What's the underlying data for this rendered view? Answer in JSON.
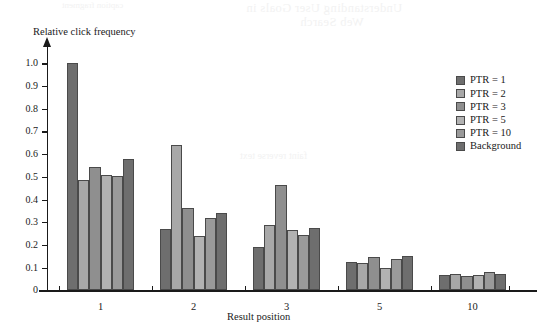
{
  "figure": {
    "ylabel": "Relative click frequency",
    "xlabel": "Result position"
  },
  "bleed_through": {
    "line1": "Understanding User Goals in",
    "line2": "Web Search",
    "line3": "caption fragment",
    "line4": "faint reverse text"
  },
  "legend": {
    "items": [
      {
        "label": "PTR = 1",
        "color": "#6e6e6e"
      },
      {
        "label": "PTR = 2",
        "color": "#a8a8a8"
      },
      {
        "label": "PTR = 3",
        "color": "#8f8f8f"
      },
      {
        "label": "PTR = 5",
        "color": "#b2b2b2"
      },
      {
        "label": "PTR = 10",
        "color": "#9a9a9a"
      },
      {
        "label": "Background",
        "color": "#6e6e6e"
      }
    ]
  },
  "chart_data": {
    "type": "bar",
    "title": "",
    "xlabel": "Result position",
    "ylabel": "Relative click frequency",
    "categories": [
      "1",
      "2",
      "3",
      "5",
      "10"
    ],
    "ylim": [
      0,
      1.05
    ],
    "yticks": [
      "0",
      "0.1",
      "0.2",
      "0.3",
      "0.4",
      "0.5",
      "0.6",
      "0.7",
      "0.8",
      "0.9",
      "1.0"
    ],
    "ytick_values": [
      0,
      0.1,
      0.2,
      0.3,
      0.4,
      0.5,
      0.6,
      0.7,
      0.8,
      0.9,
      1.0
    ],
    "grid": false,
    "legend_position": "right",
    "series": [
      {
        "name": "PTR = 1",
        "color": "#6e6e6e",
        "values": [
          1.0,
          0.27,
          0.19,
          0.125,
          0.068
        ]
      },
      {
        "name": "PTR = 2",
        "color": "#a8a8a8",
        "values": [
          0.485,
          0.64,
          0.29,
          0.12,
          0.073
        ]
      },
      {
        "name": "PTR = 3",
        "color": "#8f8f8f",
        "values": [
          0.545,
          0.365,
          0.465,
          0.145,
          0.065
        ]
      },
      {
        "name": "PTR = 5",
        "color": "#b2b2b2",
        "values": [
          0.51,
          0.24,
          0.265,
          0.1,
          0.068
        ]
      },
      {
        "name": "PTR = 10",
        "color": "#9a9a9a",
        "values": [
          0.505,
          0.32,
          0.245,
          0.14,
          0.08
        ]
      },
      {
        "name": "Background",
        "color": "#6e6e6e",
        "values": [
          0.58,
          0.34,
          0.275,
          0.15,
          0.072
        ]
      }
    ]
  }
}
